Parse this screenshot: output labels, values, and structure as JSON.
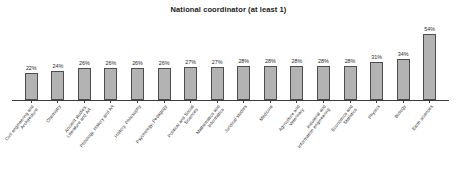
{
  "chart_data": {
    "type": "bar",
    "title": "National coordinator (at least 1)",
    "xlabel": "",
    "ylabel": "",
    "ylim": [
      0,
      60
    ],
    "grid": false,
    "legend": null,
    "value_suffix": "%",
    "categories": [
      "Civil engineering and Architecture",
      "Chemistry",
      "Ancient studies, Literature and Art",
      "Philology, History and Art",
      "History, Philosophy",
      "Psychology, Pedagogy",
      "Political and Social Sciences",
      "Mathematics and Informatics",
      "Juridical studies",
      "Medicine",
      "Agriculture and Veterinary",
      "Industrial and Information engineering",
      "Economics and Statistics",
      "Physics",
      "Biology",
      "Earth sciences"
    ],
    "category_lines": [
      [
        "Civil engineering and",
        "Architecture"
      ],
      [
        "Chemistry"
      ],
      [
        "Ancient studies,",
        "Literature and Art"
      ],
      [
        "Philology, History and Art"
      ],
      [
        "History, Philosophy"
      ],
      [
        "Psychology, Pedagogy"
      ],
      [
        "Political and Social",
        "Sciences"
      ],
      [
        "Mathematics and",
        "Informatics"
      ],
      [
        "Juridical studies"
      ],
      [
        "Medicine"
      ],
      [
        "Agriculture and",
        "Veterinary"
      ],
      [
        "Industrial and",
        "Information engineering"
      ],
      [
        "Economics and",
        "Statistics"
      ],
      [
        "Physics"
      ],
      [
        "Biology"
      ],
      [
        "Earth sciences"
      ]
    ],
    "values": [
      22,
      24,
      26,
      26,
      26,
      26,
      27,
      27,
      28,
      28,
      28,
      28,
      28,
      31,
      34,
      54
    ],
    "value_labels": [
      "22%",
      "24%",
      "26%",
      "26%",
      "26%",
      "26%",
      "27%",
      "27%",
      "28%",
      "28%",
      "28%",
      "28%",
      "28%",
      "31%",
      "34%",
      "54%"
    ],
    "colors": {
      "bar_fill": "#b3b3b3",
      "bar_stroke": "#4d4d4d",
      "axis": "#3a3a3a",
      "text": "#2b2b2b",
      "background": "#ffffff"
    }
  }
}
